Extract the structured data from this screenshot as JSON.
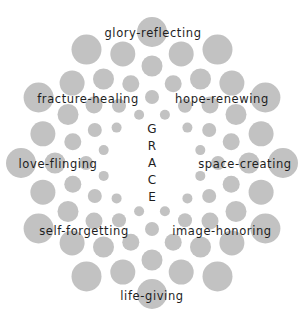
{
  "diagram": {
    "center_word": "GRACE",
    "center_letters": [
      "G",
      "R",
      "A",
      "C",
      "E"
    ],
    "dot_color": "#c2c2c2",
    "text_color": "#1e1e1e",
    "center": [
      152,
      163
    ],
    "rings": [
      {
        "dist": 50,
        "offset_deg": 15,
        "r": 5
      },
      {
        "dist": 66,
        "offset_deg": 0,
        "r": 7
      },
      {
        "dist": 82,
        "offset_deg": 15,
        "r": 8.5
      },
      {
        "dist": 97,
        "offset_deg": 0,
        "r": 10.5
      },
      {
        "dist": 113,
        "offset_deg": 15,
        "r": 12.5
      },
      {
        "dist": 131,
        "offset_deg": 0,
        "r": 15
      }
    ],
    "dots_per_ring": 12,
    "labels": [
      {
        "text": "glory-reflecting",
        "x": 153,
        "y": 34
      },
      {
        "text": "fracture-healing",
        "x": 88,
        "y": 100
      },
      {
        "text": "hope-renewing",
        "x": 222,
        "y": 100
      },
      {
        "text": "love-flinging",
        "x": 58,
        "y": 165
      },
      {
        "text": "space-creating",
        "x": 245,
        "y": 165
      },
      {
        "text": "self-forgetting",
        "x": 84,
        "y": 232
      },
      {
        "text": "image-honoring",
        "x": 222,
        "y": 232
      },
      {
        "text": "life-giving",
        "x": 152,
        "y": 297
      }
    ]
  }
}
